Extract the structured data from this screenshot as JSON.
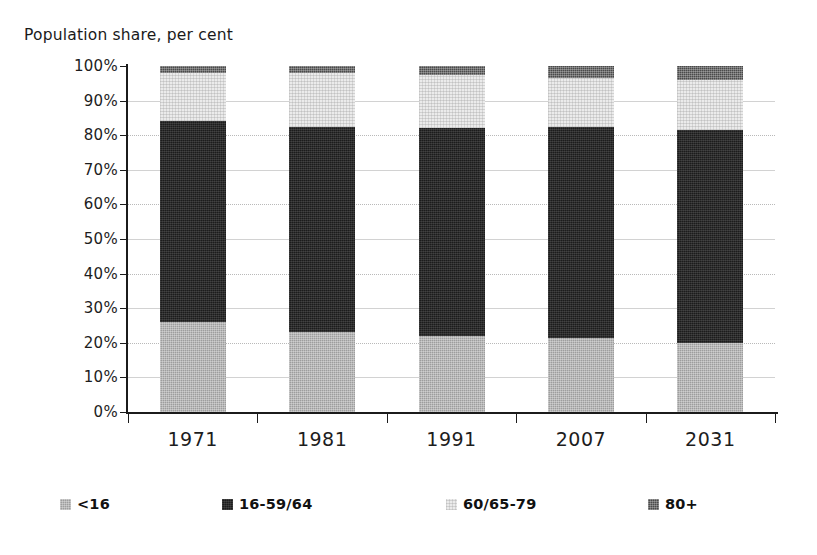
{
  "chart_data": {
    "type": "bar",
    "stacked": true,
    "title": "Population share, per cent",
    "xlabel": "",
    "ylabel": "",
    "categories": [
      "1971",
      "1981",
      "1991",
      "2007",
      "2031"
    ],
    "series": [
      {
        "name": "<16",
        "color": "#9d9d9d",
        "values": [
          26.0,
          23.0,
          22.0,
          21.5,
          20.0
        ]
      },
      {
        "name": "16-59/64",
        "color": "#1c1c1c",
        "values": [
          58.0,
          59.5,
          60.0,
          61.0,
          61.5
        ]
      },
      {
        "name": "60/65-79",
        "color": "#ebebeb",
        "values": [
          14.0,
          15.5,
          15.5,
          14.0,
          14.5
        ]
      },
      {
        "name": "80+",
        "color": "#4a4a4a",
        "values": [
          2.0,
          2.0,
          2.5,
          3.5,
          4.0
        ]
      }
    ],
    "ylim": [
      0,
      100
    ],
    "yticks": [
      0,
      10,
      20,
      30,
      40,
      50,
      60,
      70,
      80,
      90,
      100
    ],
    "ytick_labels": [
      "0%",
      "10%",
      "20%",
      "30%",
      "40%",
      "50%",
      "60%",
      "70%",
      "80%",
      "90%",
      "100%"
    ],
    "grid": true,
    "grid_axis": "y",
    "legend_position": "bottom",
    "legend_entries": [
      "<16",
      "16-59/64",
      "60/65-79",
      "80+"
    ]
  },
  "axis_title": "Population share, per cent",
  "legend": {
    "items": [
      {
        "label": "<16",
        "swatch": "legend-swatch-under16"
      },
      {
        "label": "16-59/64",
        "swatch": "legend-swatch-working-age"
      },
      {
        "label": "60/65-79",
        "swatch": "legend-swatch-older"
      },
      {
        "label": "80+",
        "swatch": "legend-swatch-80plus"
      }
    ]
  }
}
